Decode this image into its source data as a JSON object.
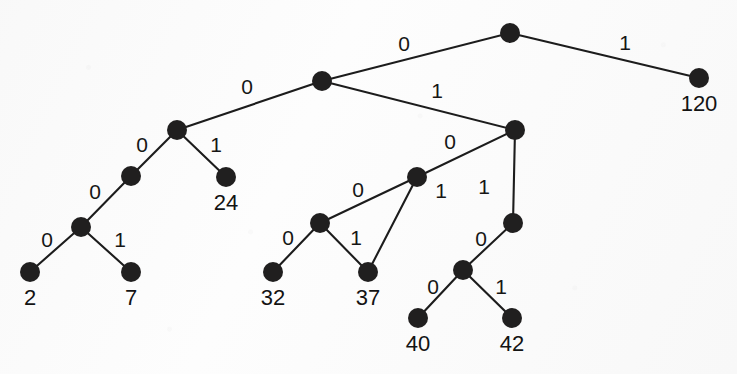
{
  "figure": {
    "kind": "binary-code-tree",
    "width": 737,
    "height": 374,
    "background_color": "#fdfdfd",
    "ink_color": "#1c1c1c",
    "node_radius": 10,
    "edge_width": 2.1
  },
  "chart_data": {
    "type": "diagram",
    "diagram_type": "binary-tree",
    "title": "",
    "xlabel": "",
    "ylabel": "",
    "nodes": [
      {
        "id": "root",
        "x": 510,
        "y": 33,
        "kind": "internal",
        "label": ""
      },
      {
        "id": "n0",
        "x": 322,
        "y": 81,
        "kind": "internal",
        "label": ""
      },
      {
        "id": "n00",
        "x": 177,
        "y": 130,
        "kind": "internal",
        "label": ""
      },
      {
        "id": "n000",
        "x": 131,
        "y": 176,
        "kind": "internal",
        "label": ""
      },
      {
        "id": "n0000",
        "x": 81,
        "y": 227,
        "kind": "internal",
        "label": ""
      },
      {
        "id": "n01",
        "x": 515,
        "y": 130,
        "kind": "internal",
        "label": ""
      },
      {
        "id": "n010",
        "x": 417,
        "y": 177,
        "kind": "internal",
        "label": ""
      },
      {
        "id": "n0100",
        "x": 320,
        "y": 223,
        "kind": "internal",
        "label": ""
      },
      {
        "id": "n0101",
        "x": 513,
        "y": 223,
        "kind": "internal",
        "label": ""
      },
      {
        "id": "n01010",
        "x": 463,
        "y": 270,
        "kind": "internal",
        "label": ""
      },
      {
        "id": "L2",
        "x": 30,
        "y": 272,
        "kind": "leaf",
        "label": "2"
      },
      {
        "id": "L7",
        "x": 131,
        "y": 272,
        "kind": "leaf",
        "label": "7"
      },
      {
        "id": "L24",
        "x": 226,
        "y": 177,
        "kind": "leaf",
        "label": "24"
      },
      {
        "id": "L32",
        "x": 273,
        "y": 272,
        "kind": "leaf",
        "label": "32"
      },
      {
        "id": "L37",
        "x": 368,
        "y": 272,
        "kind": "leaf",
        "label": "37"
      },
      {
        "id": "L40",
        "x": 418,
        "y": 318,
        "kind": "leaf",
        "label": "40"
      },
      {
        "id": "L42",
        "x": 512,
        "y": 318,
        "kind": "leaf",
        "label": "42"
      },
      {
        "id": "L120",
        "x": 699,
        "y": 78,
        "kind": "leaf",
        "label": "120"
      }
    ],
    "edges": [
      {
        "from": "root",
        "to": "n0",
        "bit": "0",
        "label_x": 404,
        "label_y": 43
      },
      {
        "from": "root",
        "to": "L120",
        "bit": "1",
        "label_x": 625,
        "label_y": 42
      },
      {
        "from": "n0",
        "to": "n00",
        "bit": "0",
        "label_x": 247,
        "label_y": 86
      },
      {
        "from": "n0",
        "to": "n01",
        "bit": "1",
        "label_x": 437,
        "label_y": 90
      },
      {
        "from": "n00",
        "to": "n000",
        "bit": "0",
        "label_x": 142,
        "label_y": 144
      },
      {
        "from": "n00",
        "to": "L24",
        "bit": "1",
        "label_x": 216,
        "label_y": 144
      },
      {
        "from": "n000",
        "to": "n0000",
        "bit": "0",
        "label_x": 95,
        "label_y": 191
      },
      {
        "from": "n0000",
        "to": "L2",
        "bit": "0",
        "label_x": 47,
        "label_y": 239
      },
      {
        "from": "n0000",
        "to": "L7",
        "bit": "1",
        "label_x": 120,
        "label_y": 239
      },
      {
        "from": "n01",
        "to": "n010",
        "bit": "0",
        "label_x": 450,
        "label_y": 141
      },
      {
        "from": "n01",
        "to": "n0101",
        "bit": "1",
        "label_x": 484,
        "label_y": 186
      },
      {
        "from": "n010",
        "to": "n0100",
        "bit": "0",
        "label_x": 358,
        "label_y": 189
      },
      {
        "from": "n010",
        "to": "L37",
        "bit": "1",
        "label_x": 441,
        "label_y": 190
      },
      {
        "from": "n0100",
        "to": "L32",
        "bit": "0",
        "label_x": 288,
        "label_y": 237
      },
      {
        "from": "n0100",
        "to": "L37",
        "bit": "1",
        "label_x": 356,
        "label_y": 237
      },
      {
        "from": "n0101",
        "to": "n01010",
        "bit": "0",
        "label_x": 481,
        "label_y": 238
      },
      {
        "from": "n01010",
        "to": "L40",
        "bit": "0",
        "label_x": 433,
        "label_y": 286
      },
      {
        "from": "n01010",
        "to": "L42",
        "bit": "1",
        "label_x": 501,
        "label_y": 286
      }
    ],
    "leaf_values": [
      2,
      7,
      24,
      32,
      37,
      40,
      42,
      120
    ],
    "codes": [
      {
        "value": "2",
        "code": "000000"
      },
      {
        "value": "7",
        "code": "000001"
      },
      {
        "value": "24",
        "code": "001"
      },
      {
        "value": "32",
        "code": "01000"
      },
      {
        "value": "37",
        "code": "01001"
      },
      {
        "value": "40",
        "code": "011000"
      },
      {
        "value": "42",
        "code": "011001"
      },
      {
        "value": "120",
        "code": "1"
      }
    ]
  }
}
